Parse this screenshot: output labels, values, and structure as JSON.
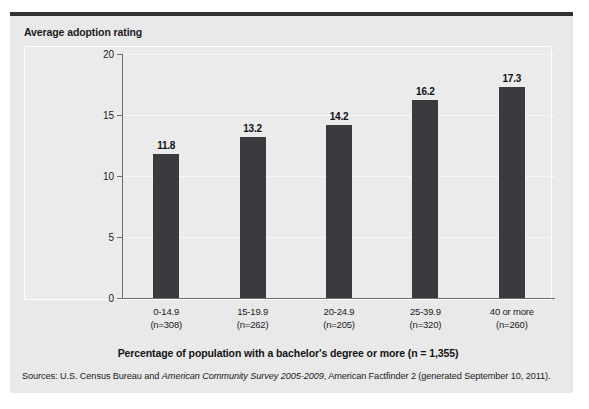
{
  "figure": {
    "y_axis_title": "Average adoption rating",
    "x_axis_title": "Percentage of population with a bachelor's degree or more (n = 1,355)",
    "source_prefix": "Sources: U.S. Census Bureau and ",
    "source_italic": "American Community Survey 2005-2009",
    "source_suffix": ", American Factfinder 2 (generated September 10, 2011).",
    "bar_color": "#3b3b3f",
    "panel_color": "#e9e9e9",
    "rule_color": "#2f3134"
  },
  "chart_data": {
    "type": "bar",
    "title": "",
    "xlabel": "Percentage of population with a bachelor's degree or more (n = 1,355)",
    "ylabel": "Average adoption rating",
    "categories": [
      "0-14.9",
      "15-19.9",
      "20-24.9",
      "25-39.9",
      "40 or more"
    ],
    "category_sublabels": [
      "(n=308)",
      "(n=262)",
      "(n=205)",
      "(n=320)",
      "(n=260)"
    ],
    "values": [
      11.8,
      13.2,
      14.2,
      16.2,
      17.3
    ],
    "value_labels": [
      "11.8",
      "13.2",
      "14.2",
      "16.2",
      "17.3"
    ],
    "ylim": [
      0,
      20
    ],
    "yticks": [
      0,
      5,
      10,
      15,
      20
    ],
    "ytick_labels": [
      "0",
      "5",
      "10",
      "15",
      "20"
    ],
    "grid": true,
    "legend": "none"
  }
}
